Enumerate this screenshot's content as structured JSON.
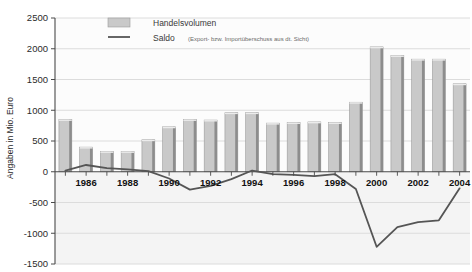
{
  "chart_data": {
    "type": "bar",
    "title": "",
    "xlabel": "",
    "ylabel": "Angaben in Mio. Euro",
    "ylim": [
      -1500,
      2500
    ],
    "ytick_step": 500,
    "grid": true,
    "legend_position": "top-center",
    "x": [
      1985,
      1986,
      1987,
      1988,
      1989,
      1990,
      1991,
      1992,
      1993,
      1994,
      1995,
      1996,
      1997,
      1998,
      1999,
      2000,
      2001,
      2002,
      2003,
      2004
    ],
    "categories": [
      "1985",
      "1986",
      "1987",
      "1988",
      "1989",
      "1990",
      "1991",
      "1992",
      "1993",
      "1994",
      "1995",
      "1996",
      "1997",
      "1998",
      "1999",
      "2000",
      "2001",
      "2002",
      "2003",
      "2004"
    ],
    "xtick_labels": [
      "1986",
      "1988",
      "1990",
      "1992",
      "1994",
      "1996",
      "1998",
      "2000",
      "2002",
      "2004"
    ],
    "ytick_labels": [
      "2500",
      "2000",
      "1500",
      "1000",
      "500",
      "0",
      "-500",
      "-1000",
      "-1500"
    ],
    "series": [
      {
        "name": "Handelsvolumen",
        "type": "bar",
        "color": "#c9c9c9",
        "values": [
          850,
          400,
          330,
          330,
          520,
          730,
          850,
          840,
          960,
          960,
          790,
          800,
          810,
          800,
          1130,
          2030,
          1890,
          1830,
          1830,
          1430
        ]
      },
      {
        "name": "Saldo",
        "type": "line",
        "color": "#555555",
        "note": "(Export- bzw. Importüberschuss aus dt. Sicht)",
        "values": [
          20,
          110,
          60,
          40,
          10,
          -110,
          -290,
          -230,
          -120,
          20,
          -40,
          -50,
          -70,
          -40,
          -280,
          -1220,
          -900,
          -820,
          -790,
          -270
        ]
      }
    ],
    "legend": [
      {
        "label": "Handelsvolumen",
        "note": "",
        "marker": "swatch"
      },
      {
        "label": "Saldo",
        "note": "(Export- bzw. Importüberschuss aus dt. Sicht)",
        "marker": "line"
      }
    ]
  },
  "axis": {
    "y_title": "Angaben in Mio. Euro"
  }
}
